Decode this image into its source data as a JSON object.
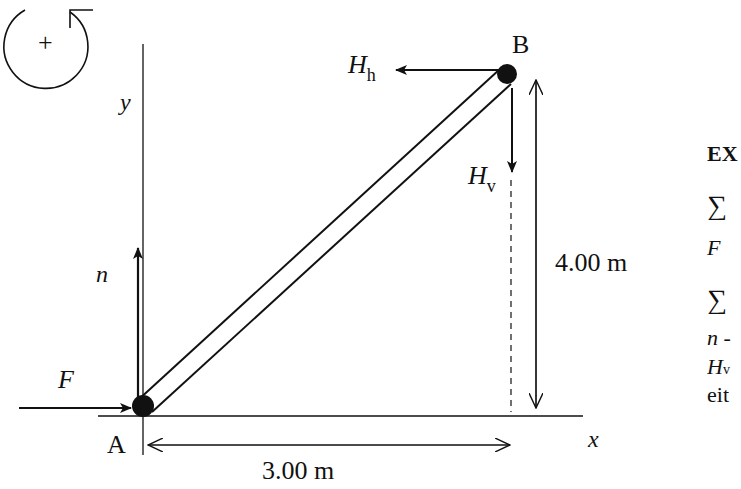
{
  "diagram": {
    "rotation_sign": "+",
    "axes": {
      "x_label": "x",
      "y_label": "y"
    },
    "points": {
      "A": "A",
      "B": "B"
    },
    "forces": {
      "F": "F",
      "n": "n",
      "H_h": {
        "main": "H",
        "sub": "h"
      },
      "H_v": {
        "main": "H",
        "sub": "v"
      }
    },
    "dimensions": {
      "horizontal": "3.00 m",
      "vertical": "4.00 m"
    },
    "colors": {
      "ink": "#111111",
      "background": "#ffffff"
    }
  },
  "side_text": {
    "heading": "EX",
    "eq1_sigma": "∑",
    "eq1_line": "F",
    "eq2_sigma": "∑",
    "eq2_line1": "n -",
    "eq2_line2": "H",
    "eq2_line2_sub": "v",
    "eq2_line3": "eit"
  }
}
